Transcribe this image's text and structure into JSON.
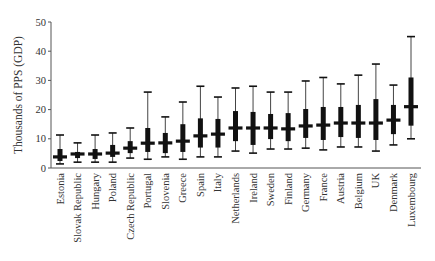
{
  "chart_data": {
    "type": "boxplot",
    "title": "",
    "xlabel": "",
    "ylabel": "Thousands of PPS (GDP)",
    "ylim": [
      0,
      50
    ],
    "yticks": [
      0,
      10,
      20,
      30,
      40,
      50
    ],
    "grid": false,
    "legend": null,
    "categories": [
      "Estonia",
      "Slovak Republic",
      "Hungary",
      "Poland",
      "Czech Republic",
      "Portugal",
      "Slovenia",
      "Greece",
      "Spain",
      "Italy",
      "Netherlands",
      "Ireland",
      "Sweden",
      "Finland",
      "Germany",
      "France",
      "Austria",
      "Belgium",
      "UK",
      "Denmark",
      "Luxembourg"
    ],
    "series": [
      {
        "name": "whisker_low",
        "values": [
          1.4,
          2.0,
          2.0,
          2.0,
          3.4,
          3.0,
          3.8,
          3.0,
          3.8,
          3.8,
          5.8,
          5.1,
          6.5,
          6.5,
          6.8,
          6.2,
          7.2,
          7.2,
          5.8,
          7.9,
          10.0
        ]
      },
      {
        "name": "q1",
        "values": [
          2.4,
          3.4,
          3.1,
          3.8,
          5.1,
          5.5,
          5.1,
          5.5,
          7.0,
          7.0,
          9.2,
          7.9,
          9.9,
          9.2,
          10.3,
          9.6,
          10.6,
          10.3,
          9.6,
          11.6,
          14.5
        ]
      },
      {
        "name": "median",
        "values": [
          3.8,
          4.8,
          4.8,
          5.1,
          6.8,
          8.5,
          8.6,
          9.2,
          11.0,
          11.6,
          13.7,
          13.7,
          13.7,
          13.4,
          14.4,
          14.7,
          15.4,
          15.4,
          15.4,
          16.4,
          21.0
        ]
      },
      {
        "name": "q3",
        "values": [
          6.5,
          5.5,
          6.5,
          7.9,
          9.2,
          13.7,
          12.0,
          15.0,
          17.0,
          16.8,
          19.5,
          19.2,
          18.5,
          18.8,
          20.2,
          20.9,
          20.9,
          21.6,
          23.6,
          21.6,
          31.0
        ]
      },
      {
        "name": "whisker_high",
        "values": [
          11.3,
          8.6,
          11.3,
          12.0,
          13.7,
          26.0,
          17.5,
          22.6,
          28.0,
          24.3,
          27.4,
          28.0,
          26.0,
          26.0,
          29.8,
          31.0,
          28.8,
          31.8,
          35.6,
          28.4,
          45.0
        ]
      }
    ]
  },
  "style": {
    "box_color": "#111111",
    "whisker_color": "#444444",
    "axis_color": "#555555"
  }
}
